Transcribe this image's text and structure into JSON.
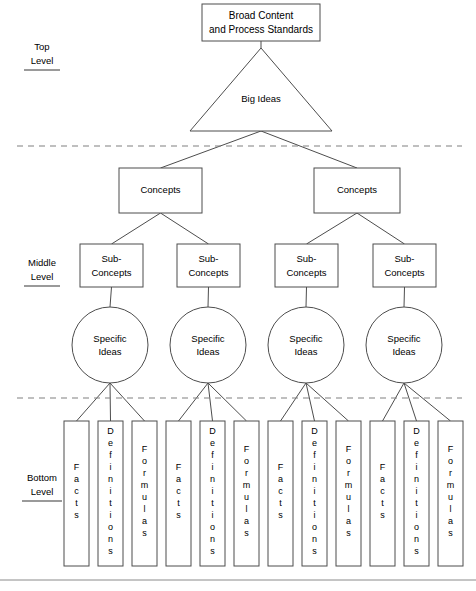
{
  "diagram": {
    "colors": {
      "shape_stroke": "#4d4d4d",
      "connector": "#4d4d4d",
      "dashed_divider": "#808080",
      "bottom_rule": "#8a8a8a",
      "label_underline": "#9a9a9a",
      "background": "#ffffff",
      "text": "#000000"
    },
    "level_labels": [
      {
        "line1": "Top",
        "line2": "Level",
        "x": 42,
        "y1": 50,
        "y2": 64,
        "underline_y": 70,
        "underline_w": 36
      },
      {
        "line1": "Middle",
        "line2": "Level",
        "x": 42,
        "y1": 266,
        "y2": 280,
        "underline_y": 286,
        "underline_w": 36
      },
      {
        "line1": "Bottom",
        "line2": "Level",
        "x": 42,
        "y1": 481,
        "y2": 495,
        "underline_y": 501,
        "underline_w": 40
      }
    ],
    "top_box": {
      "line1": "Broad Content",
      "line2": "and Process Standards",
      "x": 202,
      "y": 4,
      "w": 118,
      "h": 37
    },
    "triangle": {
      "label": "Big Ideas",
      "apex_x": 261,
      "apex_y": 48,
      "left_x": 190,
      "right_x": 332,
      "base_y": 131,
      "label_x": 261,
      "label_y": 99
    },
    "dashed_dividers": [
      {
        "y": 146,
        "x1": 17,
        "x2": 462
      },
      {
        "y": 398,
        "x1": 17,
        "x2": 462
      }
    ],
    "bottom_rule": {
      "y": 580,
      "x1": 0,
      "x2": 476
    },
    "concepts": [
      {
        "label": "Concepts",
        "x": 119,
        "y": 168,
        "w": 83,
        "h": 45
      },
      {
        "label": "Concepts",
        "x": 314,
        "y": 168,
        "w": 86,
        "h": 45
      }
    ],
    "sub_concepts": [
      {
        "line1": "Sub-",
        "line2": "Concepts",
        "x": 80,
        "y": 244,
        "w": 63,
        "h": 43
      },
      {
        "line1": "Sub-",
        "line2": "Concepts",
        "x": 177,
        "y": 244,
        "w": 63,
        "h": 43
      },
      {
        "line1": "Sub-",
        "line2": "Concepts",
        "x": 275,
        "y": 244,
        "w": 63,
        "h": 43
      },
      {
        "line1": "Sub-",
        "line2": "Concepts",
        "x": 373,
        "y": 244,
        "w": 63,
        "h": 43
      }
    ],
    "specific_ideas": [
      {
        "line1": "Specific",
        "line2": "Ideas",
        "cx": 110,
        "cy": 345,
        "r": 38
      },
      {
        "line1": "Specific",
        "line2": "Ideas",
        "cx": 208,
        "cy": 345,
        "r": 38
      },
      {
        "line1": "Specific",
        "line2": "Ideas",
        "cx": 306,
        "cy": 345,
        "r": 38
      },
      {
        "line1": "Specific",
        "line2": "Ideas",
        "cx": 404,
        "cy": 345,
        "r": 38
      }
    ],
    "bottom_boxes": [
      {
        "label": "Facts",
        "x": 64,
        "y": 421,
        "w": 25,
        "h": 145
      },
      {
        "label": "Definitions",
        "x": 98,
        "y": 421,
        "w": 25,
        "h": 145
      },
      {
        "label": "Formulas",
        "x": 132,
        "y": 421,
        "w": 25,
        "h": 145
      },
      {
        "label": "Facts",
        "x": 166,
        "y": 421,
        "w": 25,
        "h": 145
      },
      {
        "label": "Definitions",
        "x": 200,
        "y": 421,
        "w": 25,
        "h": 145
      },
      {
        "label": "Formulas",
        "x": 234,
        "y": 421,
        "w": 25,
        "h": 145
      },
      {
        "label": "Facts",
        "x": 268,
        "y": 421,
        "w": 25,
        "h": 145
      },
      {
        "label": "Definitions",
        "x": 302,
        "y": 421,
        "w": 25,
        "h": 145
      },
      {
        "label": "Formulas",
        "x": 336,
        "y": 421,
        "w": 25,
        "h": 145
      },
      {
        "label": "Facts",
        "x": 370,
        "y": 421,
        "w": 25,
        "h": 145
      },
      {
        "label": "Definitions",
        "x": 404,
        "y": 421,
        "w": 25,
        "h": 145
      },
      {
        "label": "Formulas",
        "x": 438,
        "y": 421,
        "w": 25,
        "h": 145
      }
    ]
  }
}
